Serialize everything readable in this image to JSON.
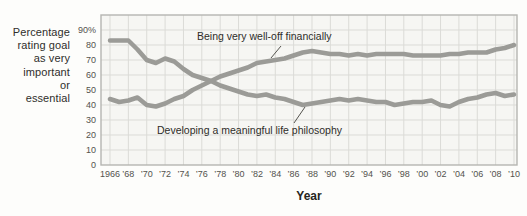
{
  "figure": {
    "y_axis_title_lines": [
      "Percentage",
      "rating goal",
      "as very",
      "important",
      "or",
      "essential"
    ],
    "x_axis_title": "Year"
  },
  "chart_data": {
    "type": "line",
    "x": [
      1966,
      1967,
      1968,
      1969,
      1970,
      1971,
      1972,
      1973,
      1974,
      1975,
      1976,
      1977,
      1978,
      1979,
      1980,
      1981,
      1982,
      1983,
      1984,
      1985,
      1986,
      1987,
      1988,
      1989,
      1990,
      1991,
      1992,
      1993,
      1994,
      1995,
      1996,
      1997,
      1998,
      1999,
      2000,
      2001,
      2002,
      2003,
      2004,
      2005,
      2006,
      2007,
      2008,
      2009,
      2010
    ],
    "series": [
      {
        "name": "Being very well-off financially",
        "values": [
          44,
          42,
          43,
          45,
          40,
          39,
          41,
          44,
          46,
          50,
          53,
          56,
          59,
          61,
          63,
          65,
          68,
          69,
          70,
          71,
          73,
          75,
          76,
          75,
          74,
          74,
          73,
          74,
          73,
          74,
          74,
          74,
          74,
          73,
          73,
          73,
          73,
          74,
          74,
          75,
          75,
          75,
          77,
          78,
          80
        ]
      },
      {
        "name": "Developing a meaningful life philosophy",
        "values": [
          83,
          83,
          83,
          77,
          70,
          68,
          71,
          69,
          64,
          60,
          58,
          56,
          53,
          51,
          49,
          47,
          46,
          47,
          45,
          44,
          42,
          40,
          41,
          42,
          43,
          44,
          43,
          44,
          43,
          42,
          42,
          40,
          41,
          42,
          42,
          43,
          40,
          39,
          42,
          44,
          45,
          47,
          48,
          46,
          47
        ]
      }
    ],
    "title": "",
    "xlabel": "Year",
    "ylabel": "Percentage rating goal as very important or essential",
    "xlim": [
      1966,
      2010
    ],
    "ylim": [
      0,
      100
    ],
    "grid": true,
    "legend_position": "inline-annotations",
    "y_ticks": [
      90,
      80,
      70,
      60,
      50,
      40,
      30,
      20,
      10,
      0
    ],
    "y_tick_labels": [
      "90%",
      "80",
      "70",
      "60",
      "50",
      "40",
      "30",
      "20",
      "10",
      "0"
    ],
    "x_tick_years": [
      1966,
      1968,
      1970,
      1972,
      1974,
      1976,
      1978,
      1980,
      1982,
      1984,
      1986,
      1988,
      1990,
      1992,
      1994,
      1996,
      1998,
      2000,
      2002,
      2004,
      2006,
      2008,
      2010
    ],
    "x_tick_labels": [
      "1966",
      "’68",
      "’70",
      "’72",
      "’74",
      "’76",
      "’78",
      "’80",
      "’82",
      "’84",
      "’86",
      "’88",
      "’90",
      "’92",
      "’94",
      "’96",
      "’98",
      "’00",
      "’02",
      "’04",
      "’06",
      "’08",
      "’10"
    ],
    "annotations": [
      {
        "text": "Being very well-off financially",
        "series": "financial"
      },
      {
        "text": "Developing a meaningful life philosophy",
        "series": "philosophy"
      }
    ],
    "colors": {
      "line": "#9b9b97",
      "gridline": "#dbdbd7",
      "frame": "#b5b5b1",
      "plot_background": "#f6f6f3",
      "text_dark": "#2f2e2b",
      "tick_text": "#53524d",
      "leader_line": "#55544f"
    }
  }
}
